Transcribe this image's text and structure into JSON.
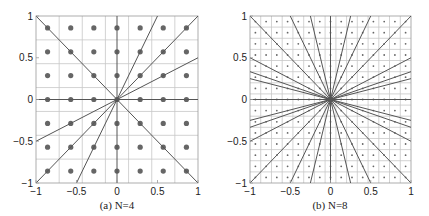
{
  "chart_data": [
    {
      "type": "scatter",
      "title": "",
      "caption": "(a)  N=4",
      "xlabel": "",
      "ylabel": "",
      "xlim": [
        -1,
        1
      ],
      "ylim": [
        -1,
        1
      ],
      "xticks": [
        -1,
        -0.5,
        0,
        0.5,
        1
      ],
      "xtick_labels": [
        "−1",
        "−0.5",
        "0",
        "0.5",
        "1"
      ],
      "yticks": [
        -1,
        -0.5,
        0,
        0.5,
        1
      ],
      "ytick_labels": [
        "−1",
        "−0.5",
        "0",
        "0.5",
        "1"
      ],
      "grid": true,
      "grid_lines": [
        -0.714,
        -0.429,
        -0.143,
        0.143,
        0.429,
        0.714
      ],
      "dot_grid": {
        "n": 7,
        "positions": [
          -0.857,
          -0.571,
          -0.286,
          0,
          0.286,
          0.571,
          0.857
        ],
        "dot_radius": 2.6
      },
      "lines_through_origin": [
        {
          "direction": [
            1,
            0
          ]
        },
        {
          "direction": [
            0,
            1
          ]
        },
        {
          "direction": [
            1,
            1
          ]
        },
        {
          "direction": [
            1,
            -1
          ]
        },
        {
          "direction": [
            1,
            0.5
          ]
        },
        {
          "direction": [
            0.5,
            1
          ]
        }
      ],
      "frame": {
        "x": 36,
        "y": 16,
        "w": 162,
        "h": 167
      }
    },
    {
      "type": "scatter",
      "title": "",
      "caption": "(b)  N=8",
      "xlabel": "",
      "ylabel": "",
      "xlim": [
        -1,
        1
      ],
      "ylim": [
        -1,
        1
      ],
      "xticks": [
        -1,
        -0.5,
        0,
        0.5,
        1
      ],
      "xtick_labels": [
        "−1",
        "−0.5",
        "0",
        "0.5",
        "1"
      ],
      "yticks": [
        -1,
        -0.5,
        0,
        0.5,
        1
      ],
      "ytick_labels": [
        "−1",
        "−0.5",
        "0",
        "0.5",
        "1"
      ],
      "grid": true,
      "grid_lines": [
        -0.867,
        -0.733,
        -0.6,
        -0.467,
        -0.333,
        -0.2,
        -0.067,
        0.067,
        0.2,
        0.333,
        0.467,
        0.6,
        0.733,
        0.867
      ],
      "dot_grid": {
        "n": 15,
        "positions": [
          -0.933,
          -0.8,
          -0.667,
          -0.533,
          -0.4,
          -0.267,
          -0.133,
          0,
          0.133,
          0.267,
          0.4,
          0.533,
          0.667,
          0.8,
          0.933
        ],
        "dot_radius": 0.9
      },
      "lines_through_origin": [
        {
          "direction": [
            1,
            0
          ]
        },
        {
          "direction": [
            0,
            1
          ]
        },
        {
          "direction": [
            1,
            1
          ]
        },
        {
          "direction": [
            1,
            -1
          ]
        },
        {
          "direction": [
            1,
            0.5
          ]
        },
        {
          "direction": [
            1,
            -0.5
          ]
        },
        {
          "direction": [
            0.5,
            1
          ]
        },
        {
          "direction": [
            0.5,
            -1
          ]
        },
        {
          "direction": [
            1,
            0.333
          ]
        },
        {
          "direction": [
            1,
            -0.333
          ]
        },
        {
          "direction": [
            1,
            0.25
          ]
        },
        {
          "direction": [
            1,
            -0.25
          ]
        },
        {
          "direction": [
            0.25,
            1
          ]
        },
        {
          "direction": [
            0.25,
            -1
          ]
        }
      ],
      "frame": {
        "x": 250,
        "y": 16,
        "w": 161,
        "h": 167
      }
    }
  ],
  "colors": {
    "grid": "#c8c8c8",
    "frame": "#9a9a9a",
    "line": "#555555",
    "dot": "#666666",
    "text": "#222222"
  }
}
